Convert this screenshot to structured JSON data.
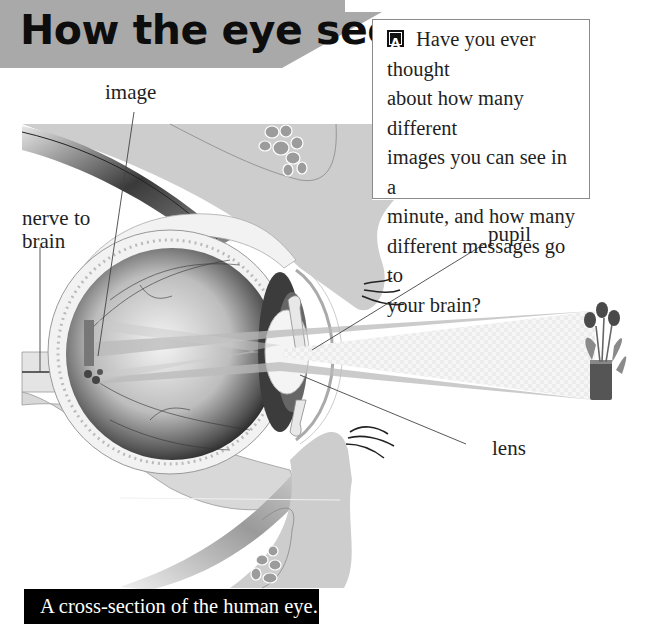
{
  "page": {
    "title": "How the eye sees",
    "question_box": {
      "icon": "activity-icon",
      "lines": [
        "Have you ever thought",
        "about how many different",
        "images you can see in a",
        "minute, and how many",
        "different messages go to",
        "your brain?"
      ]
    },
    "labels": {
      "image": "image",
      "nerve_line1": "nerve to",
      "nerve_line2": "brain",
      "pupil": "pupil",
      "lens": "lens"
    },
    "caption": "A cross-section of the human eye."
  },
  "colors": {
    "banner_gray": "#a9a9a9",
    "tissue_gray": "#cdcdcd",
    "caption_bg": "#000000",
    "caption_text": "#ffffff",
    "text": "#1f1f1f"
  }
}
